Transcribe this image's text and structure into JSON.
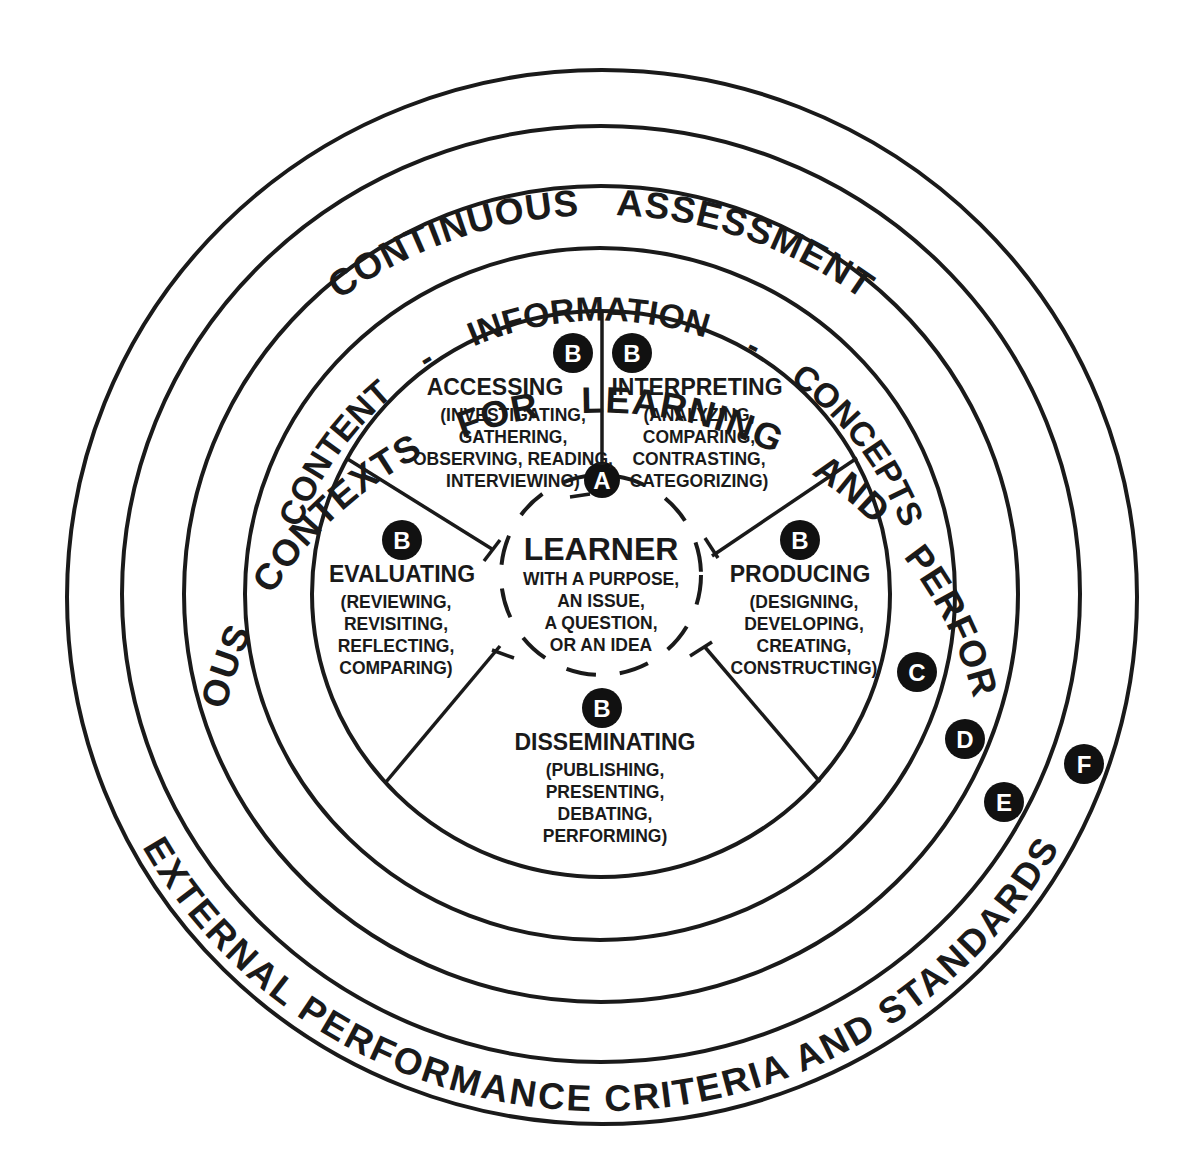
{
  "diagram": {
    "colors": {
      "ink": "#1a1a1a",
      "background": "#ffffff",
      "badge_fill": "#111111",
      "badge_text": "#ffffff"
    },
    "bands": {
      "outer_bottom": "EXTERNAL PERFORMANCE CRITERIA AND STANDARDS",
      "assessment_top": "CONTINUOUS ASSESSMENT",
      "contexts": "VARIOUS CONTEXTS FOR LEARNING AND PERFORMING",
      "content_ring": "CONTENT - INFORMATION - CONCEPTS"
    },
    "center": {
      "badge": "A",
      "title": "LEARNER",
      "lines": [
        "WITH A PURPOSE,",
        "AN ISSUE,",
        "A QUESTION,",
        "OR AN IDEA"
      ]
    },
    "segments": [
      {
        "badge": "B",
        "title": "ACCESSING",
        "lines": [
          "(INVESTIGATING,",
          "GATHERING,",
          "OBSERVING, READING,",
          "INTERVIEWING)"
        ]
      },
      {
        "badge": "B",
        "title": "INTERPRETING",
        "lines": [
          "(ANALYZING,",
          "COMPARING,",
          "CONTRASTING,",
          "CATEGORIZING)"
        ]
      },
      {
        "badge": "B",
        "title": "PRODUCING",
        "lines": [
          "(DESIGNING,",
          "DEVELOPING,",
          "CREATING,",
          "CONSTRUCTING)"
        ]
      },
      {
        "badge": "B",
        "title": "DISSEMINATING",
        "lines": [
          "(PUBLISHING,",
          "PRESENTING,",
          "DEBATING,",
          "PERFORMING)"
        ]
      },
      {
        "badge": "B",
        "title": "EVALUATING",
        "lines": [
          "(REVIEWING,",
          "REVISITING,",
          "REFLECTING,",
          "COMPARING)"
        ]
      }
    ],
    "ring_markers": [
      "C",
      "D",
      "E",
      "F"
    ]
  }
}
